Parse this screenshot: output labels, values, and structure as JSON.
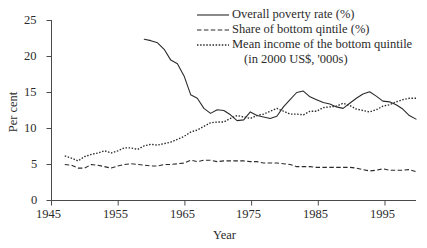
{
  "chart_data": {
    "type": "line",
    "title": "",
    "xlabel": "Year",
    "ylabel": "Per cent",
    "xlim": [
      1945,
      2000
    ],
    "ylim": [
      0,
      25
    ],
    "xticks": [
      1945,
      1955,
      1965,
      1975,
      1985,
      1995
    ],
    "yticks": [
      0,
      5,
      10,
      15,
      20,
      25
    ],
    "grid": false,
    "legend_position": "top-right",
    "series": [
      {
        "name": "Overall poverty rate (%)",
        "style": "solid",
        "color": "#2b2b2b",
        "x": [
          1959,
          1960,
          1961,
          1962,
          1963,
          1964,
          1965,
          1966,
          1967,
          1968,
          1969,
          1970,
          1971,
          1972,
          1973,
          1974,
          1975,
          1976,
          1977,
          1978,
          1979,
          1980,
          1981,
          1982,
          1983,
          1984,
          1985,
          1986,
          1987,
          1988,
          1989,
          1990,
          1991,
          1992,
          1993,
          1994,
          1995,
          1996,
          1997,
          1998,
          1999,
          2000
        ],
        "values": [
          22.4,
          22.2,
          21.9,
          21.0,
          19.5,
          19.0,
          17.3,
          14.7,
          14.2,
          12.8,
          12.1,
          12.6,
          12.5,
          11.9,
          11.1,
          11.2,
          12.3,
          11.8,
          11.6,
          11.4,
          11.7,
          13.0,
          14.0,
          15.0,
          15.2,
          14.4,
          14.0,
          13.6,
          13.4,
          13.0,
          12.8,
          13.5,
          14.2,
          14.8,
          15.1,
          14.5,
          13.8,
          13.7,
          13.3,
          12.7,
          11.8,
          11.3
        ]
      },
      {
        "name": "Share of bottom qintile (%)",
        "style": "dashed",
        "color": "#2b2b2b",
        "x": [
          1947,
          1948,
          1949,
          1950,
          1951,
          1952,
          1953,
          1954,
          1955,
          1956,
          1957,
          1958,
          1959,
          1960,
          1961,
          1962,
          1963,
          1964,
          1965,
          1966,
          1967,
          1968,
          1969,
          1970,
          1971,
          1972,
          1973,
          1974,
          1975,
          1976,
          1977,
          1978,
          1979,
          1980,
          1981,
          1982,
          1983,
          1984,
          1985,
          1986,
          1987,
          1988,
          1989,
          1990,
          1991,
          1992,
          1993,
          1994,
          1995,
          1996,
          1997,
          1998,
          1999,
          2000
        ],
        "values": [
          5.0,
          4.9,
          4.5,
          4.5,
          5.0,
          4.9,
          4.7,
          4.5,
          4.8,
          5.0,
          5.1,
          5.0,
          4.9,
          4.8,
          4.8,
          5.0,
          5.0,
          5.1,
          5.2,
          5.6,
          5.4,
          5.6,
          5.6,
          5.4,
          5.5,
          5.5,
          5.5,
          5.5,
          5.4,
          5.4,
          5.2,
          5.2,
          5.2,
          5.1,
          5.0,
          4.7,
          4.7,
          4.7,
          4.6,
          4.6,
          4.6,
          4.6,
          4.6,
          4.6,
          4.5,
          4.3,
          4.1,
          4.2,
          4.4,
          4.2,
          4.2,
          4.2,
          4.3,
          4.0
        ]
      },
      {
        "name": "Mean income of the bottom quintile (in 2000 US$, '000s)",
        "style": "dotted",
        "color": "#2b2b2b",
        "x": [
          1947,
          1948,
          1949,
          1950,
          1951,
          1952,
          1953,
          1954,
          1955,
          1956,
          1957,
          1958,
          1959,
          1960,
          1961,
          1962,
          1963,
          1964,
          1965,
          1966,
          1967,
          1968,
          1969,
          1970,
          1971,
          1972,
          1973,
          1974,
          1975,
          1976,
          1977,
          1978,
          1979,
          1980,
          1981,
          1982,
          1983,
          1984,
          1985,
          1986,
          1987,
          1988,
          1989,
          1990,
          1991,
          1992,
          1993,
          1994,
          1995,
          1996,
          1997,
          1998,
          1999,
          2000
        ],
        "values": [
          6.2,
          5.9,
          5.5,
          6.1,
          6.4,
          6.6,
          6.9,
          6.6,
          6.9,
          7.3,
          7.3,
          7.1,
          7.6,
          7.8,
          7.7,
          7.9,
          8.1,
          8.5,
          8.9,
          9.5,
          9.8,
          10.3,
          10.8,
          10.9,
          10.9,
          11.4,
          11.8,
          11.6,
          11.4,
          11.8,
          12.0,
          12.4,
          12.8,
          12.4,
          12.0,
          12.0,
          11.9,
          12.4,
          12.4,
          12.9,
          13.0,
          13.1,
          13.5,
          13.2,
          12.7,
          12.5,
          12.3,
          12.6,
          13.1,
          13.3,
          13.7,
          14.0,
          14.2,
          14.2
        ]
      }
    ],
    "legend_entries": [
      {
        "label": "Overall poverty rate (%)",
        "style": "solid"
      },
      {
        "label": "Share of bottom qintile (%)",
        "style": "dashed"
      },
      {
        "label": "Mean income of the bottom quintile",
        "style": "dotted",
        "label_line2": "(in 2000 US$, '000s)"
      }
    ]
  },
  "axes": {
    "ylabel": "Per cent",
    "xlabel": "Year",
    "ytick_labels": [
      "0",
      "5",
      "10",
      "15",
      "20",
      "25"
    ],
    "xtick_labels": [
      "1945",
      "1955",
      "1965",
      "1975",
      "1985",
      "1995"
    ]
  },
  "legend": {
    "entry1": "Overall poverty rate (%)",
    "entry2": "Share of bottom qintile (%)",
    "entry3": "Mean income of the bottom quintile",
    "entry3_line2": "(in 2000 US$, '000s)"
  }
}
